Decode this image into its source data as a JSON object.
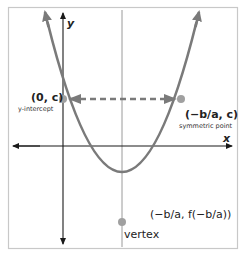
{
  "diagram": {
    "axes": {
      "x_label": "x",
      "y_label": "y"
    },
    "points": [
      {
        "id": "y_intercept",
        "coord_label": "(0, c)",
        "caption": "y-intercept"
      },
      {
        "id": "symmetric_point",
        "coord_label": "(−b/a, c)",
        "caption": "symmetric point"
      },
      {
        "id": "vertex",
        "coord_label": "(−b/a, f(−b/a))",
        "caption": "vertex"
      }
    ],
    "colors": {
      "curve": "#7a7a7a",
      "axes": "#1a1a1a",
      "symmetry_line": "#9a9a9a",
      "dashed_arrow": "#7a7a7a",
      "point": "#a0a0a0",
      "frame": "#c8c8c8"
    }
  }
}
